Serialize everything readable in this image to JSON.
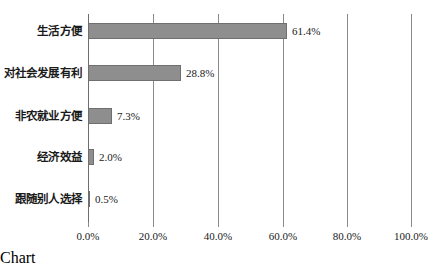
{
  "chart_data": {
    "type": "bar",
    "orientation": "horizontal",
    "title": "",
    "subtitle": "",
    "xlabel": "",
    "ylabel": "",
    "categories": [
      "生活方便",
      "对社会发展有利",
      "非农就业方便",
      "经济效益",
      "跟随别人选择"
    ],
    "values": [
      61.4,
      28.8,
      7.3,
      2.0,
      0.5
    ],
    "data_labels": [
      "61.4%",
      "28.8%",
      "7.3%",
      "2.0%",
      "0.5%"
    ],
    "xlim": [
      0,
      100
    ],
    "x_ticks": [
      0,
      20,
      40,
      60,
      80,
      100
    ],
    "x_tick_labels": [
      "0.0%",
      "20.0%",
      "40.0%",
      "60.0%",
      "80.0%",
      "100.0%"
    ],
    "grid": "vertical",
    "legend": "none",
    "series": [
      {
        "name": "",
        "values": [
          61.4,
          28.8,
          7.3,
          2.0,
          0.5
        ]
      }
    ],
    "colors": {
      "bar_fill": "#8e8e8e",
      "bar_border": "#6f6f6f",
      "gridline": "#8a8a8a",
      "axis": "#6e6e6e",
      "text": "#1a1a1a",
      "background": "#ffffff"
    }
  }
}
